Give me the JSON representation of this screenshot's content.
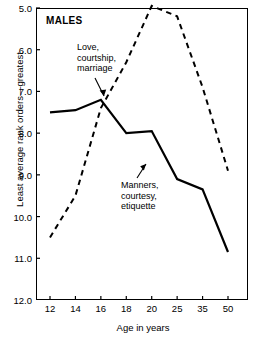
{
  "chart_data": {
    "type": "line",
    "title": "MALES",
    "xlabel": "Age in years",
    "ylabel": "Least average rank orders—greatest",
    "categories": [
      "12",
      "14",
      "16",
      "18",
      "20",
      "25",
      "35",
      "50"
    ],
    "ylim": [
      5.0,
      12.0
    ],
    "y_inverted": true,
    "yticks": [
      "5.0",
      "6.0",
      "7.0",
      "8.0",
      "9.0",
      "10.0",
      "11.0",
      "12.0"
    ],
    "grid": false,
    "legend": "annotations",
    "series": [
      {
        "name": "Love, courtship, marriage",
        "style": "dashed",
        "values": [
          10.5,
          9.5,
          7.4,
          6.3,
          4.95,
          5.2,
          6.9,
          8.9
        ]
      },
      {
        "name": "Manners, courtesy, etiquette",
        "style": "solid",
        "values": [
          7.5,
          7.45,
          7.2,
          8.0,
          7.95,
          9.1,
          9.35,
          10.85
        ]
      }
    ],
    "annotations": [
      {
        "id": "love",
        "text": "Love,\ncourtship,\nmarriage",
        "target_category": "16"
      },
      {
        "id": "manners",
        "text": "Manners,\ncourtesy,\netiquette",
        "target_category": "20"
      }
    ]
  }
}
